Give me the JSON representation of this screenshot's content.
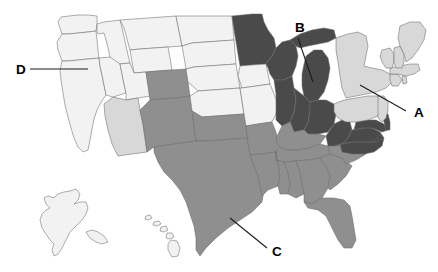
{
  "figure": {
    "type": "choropleth-map",
    "region": "United States",
    "background_color": "#ffffff",
    "border_color": "#6b6b6b",
    "has_title": false,
    "has_legend": false,
    "has_axes": false
  },
  "shade_levels": {
    "lightest": "#f2f2f2",
    "light": "#d8d8d8",
    "medium": "#8f8f8f",
    "dark": "#4a4a4a"
  },
  "callouts": [
    {
      "id": "callout-a",
      "label": "A",
      "label_x": 414,
      "label_y": 117,
      "line_x1": 406,
      "line_y1": 111,
      "line_x2": 360,
      "line_y2": 85,
      "points_to": "new-jersey"
    },
    {
      "id": "callout-b",
      "label": "B",
      "label_x": 295,
      "label_y": 32,
      "line_x1": 298,
      "line_y1": 38,
      "line_x2": 313,
      "line_y2": 82,
      "points_to": "michigan"
    },
    {
      "id": "callout-c",
      "label": "C",
      "label_x": 272,
      "label_y": 256,
      "line_x1": 267,
      "line_y1": 248,
      "line_x2": 230,
      "line_y2": 218,
      "points_to": "texas"
    },
    {
      "id": "callout-d",
      "label": "D",
      "label_x": 16,
      "label_y": 74,
      "line_x1": 30,
      "line_y1": 69,
      "line_x2": 88,
      "line_y2": 69,
      "points_to": "oregon"
    }
  ],
  "states": [
    {
      "name": "washington",
      "shade": "lightest"
    },
    {
      "name": "oregon",
      "shade": "lightest"
    },
    {
      "name": "california",
      "shade": "lightest"
    },
    {
      "name": "idaho",
      "shade": "lightest"
    },
    {
      "name": "nevada",
      "shade": "lightest"
    },
    {
      "name": "montana",
      "shade": "lightest"
    },
    {
      "name": "wyoming",
      "shade": "lightest"
    },
    {
      "name": "utah",
      "shade": "lightest"
    },
    {
      "name": "arizona",
      "shade": "light"
    },
    {
      "name": "colorado",
      "shade": "medium"
    },
    {
      "name": "new-mexico",
      "shade": "medium"
    },
    {
      "name": "north-dakota",
      "shade": "lightest"
    },
    {
      "name": "south-dakota",
      "shade": "lightest"
    },
    {
      "name": "nebraska",
      "shade": "lightest"
    },
    {
      "name": "kansas",
      "shade": "lightest"
    },
    {
      "name": "oklahoma",
      "shade": "medium"
    },
    {
      "name": "texas",
      "shade": "medium"
    },
    {
      "name": "minnesota",
      "shade": "dark"
    },
    {
      "name": "iowa",
      "shade": "lightest"
    },
    {
      "name": "missouri",
      "shade": "lightest"
    },
    {
      "name": "arkansas",
      "shade": "medium"
    },
    {
      "name": "louisiana",
      "shade": "medium"
    },
    {
      "name": "wisconsin",
      "shade": "dark"
    },
    {
      "name": "illinois",
      "shade": "dark"
    },
    {
      "name": "michigan",
      "shade": "dark"
    },
    {
      "name": "indiana",
      "shade": "dark"
    },
    {
      "name": "ohio",
      "shade": "dark"
    },
    {
      "name": "kentucky",
      "shade": "medium"
    },
    {
      "name": "tennessee",
      "shade": "medium"
    },
    {
      "name": "mississippi",
      "shade": "medium"
    },
    {
      "name": "alabama",
      "shade": "medium"
    },
    {
      "name": "georgia",
      "shade": "medium"
    },
    {
      "name": "florida",
      "shade": "medium"
    },
    {
      "name": "south-carolina",
      "shade": "medium"
    },
    {
      "name": "north-carolina",
      "shade": "medium"
    },
    {
      "name": "virginia",
      "shade": "dark"
    },
    {
      "name": "west-virginia",
      "shade": "dark"
    },
    {
      "name": "maryland",
      "shade": "dark"
    },
    {
      "name": "delaware",
      "shade": "dark"
    },
    {
      "name": "pennsylvania",
      "shade": "light"
    },
    {
      "name": "new-jersey",
      "shade": "light"
    },
    {
      "name": "new-york",
      "shade": "light"
    },
    {
      "name": "connecticut",
      "shade": "light"
    },
    {
      "name": "rhode-island",
      "shade": "light"
    },
    {
      "name": "massachusetts",
      "shade": "light"
    },
    {
      "name": "vermont",
      "shade": "light"
    },
    {
      "name": "new-hampshire",
      "shade": "light"
    },
    {
      "name": "maine",
      "shade": "light"
    },
    {
      "name": "alaska",
      "shade": "lightest"
    },
    {
      "name": "hawaii",
      "shade": "lightest"
    }
  ]
}
